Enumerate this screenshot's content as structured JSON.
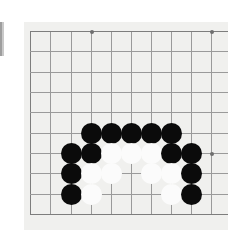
{
  "scene": {
    "kind": "go-board-photo",
    "title": "Go board position",
    "background_color": "#ffffff",
    "board_color": "#f0f0ee",
    "line_color": "#9a9a9a",
    "edge_line_color": "#7d7d7d",
    "black_stone_color": "#0b0b0b",
    "white_stone_color": "#fbfbfb"
  },
  "board": {
    "panel": {
      "x": 24,
      "y": 22,
      "width": 204,
      "height": 208
    },
    "origin": {
      "x": 30,
      "y": 31
    },
    "spacing": 20.3,
    "visible_columns": 10,
    "visible_rows": 10,
    "stone_diameter": 21,
    "columns_x": [
      30,
      50,
      71,
      91,
      111,
      131,
      151,
      171,
      191,
      211
    ],
    "rows_y": [
      31,
      51,
      72,
      92,
      112,
      133,
      153,
      173,
      194,
      214
    ],
    "star_points": [
      {
        "col": 3,
        "row": 0
      },
      {
        "col": 9,
        "row": 0
      },
      {
        "col": 9,
        "row": 6
      }
    ],
    "stones": [
      {
        "col": 3,
        "row": 5,
        "color": "black"
      },
      {
        "col": 4,
        "row": 5,
        "color": "black"
      },
      {
        "col": 5,
        "row": 5,
        "color": "black"
      },
      {
        "col": 6,
        "row": 5,
        "color": "black"
      },
      {
        "col": 7,
        "row": 5,
        "color": "black"
      },
      {
        "col": 2,
        "row": 6,
        "color": "black"
      },
      {
        "col": 3,
        "row": 6,
        "color": "black"
      },
      {
        "col": 4,
        "row": 6,
        "color": "white"
      },
      {
        "col": 5,
        "row": 6,
        "color": "white"
      },
      {
        "col": 6,
        "row": 6,
        "color": "white"
      },
      {
        "col": 7,
        "row": 6,
        "color": "black"
      },
      {
        "col": 8,
        "row": 6,
        "color": "black"
      },
      {
        "col": 2,
        "row": 7,
        "color": "black"
      },
      {
        "col": 3,
        "row": 7,
        "color": "white"
      },
      {
        "col": 4,
        "row": 7,
        "color": "white"
      },
      {
        "col": 6,
        "row": 7,
        "color": "white"
      },
      {
        "col": 7,
        "row": 7,
        "color": "white"
      },
      {
        "col": 8,
        "row": 7,
        "color": "black"
      },
      {
        "col": 2,
        "row": 8,
        "color": "black"
      },
      {
        "col": 3,
        "row": 8,
        "color": "white"
      },
      {
        "col": 7,
        "row": 8,
        "color": "white"
      },
      {
        "col": 8,
        "row": 8,
        "color": "black"
      }
    ],
    "counts": {
      "black": 14,
      "white": 8,
      "total": 22
    }
  }
}
